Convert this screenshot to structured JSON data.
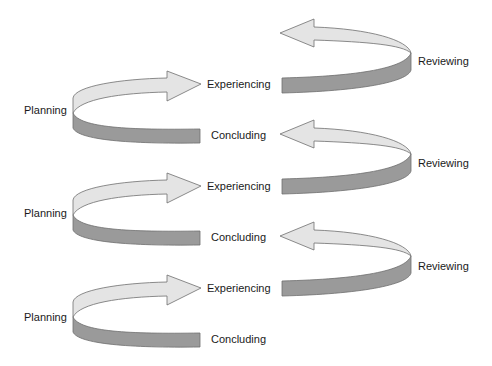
{
  "diagram": {
    "type": "spiral-cycle",
    "colors": {
      "light_band": "#e4e4e4",
      "dark_band": "#9a9a9a",
      "outline": "#6e6e6e",
      "text": "#1a1a1a"
    },
    "cycles": [
      {
        "planning": "Planning",
        "experiencing": "Experiencing",
        "reviewing": "Reviewing",
        "concluding": "Concluding"
      },
      {
        "planning": "Planning",
        "experiencing": "Experiencing",
        "reviewing": "Reviewing",
        "concluding": "Concluding"
      },
      {
        "planning": "Planning",
        "experiencing": "Experiencing",
        "reviewing": "Reviewing",
        "concluding": "Concluding"
      }
    ]
  }
}
